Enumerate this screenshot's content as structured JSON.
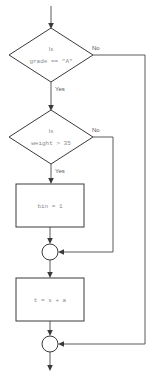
{
  "diagram": {
    "type": "flowchart",
    "title": "",
    "canvas": {
      "width": 152,
      "height": 377,
      "background": "#ffffff"
    },
    "colors": {
      "shape_stroke": "#3a3a3a",
      "connector_line": "#5a5a5a",
      "shape_fill": "#ffffff",
      "node_text": "#8a8a8a",
      "edge_label": "#555555"
    },
    "nodes": [
      {
        "id": "decision-grade",
        "shape": "diamond",
        "line1": "Is",
        "line2": "grade == \"A\"",
        "cx": 51,
        "cy": 55,
        "rx": 42,
        "ry": 27
      },
      {
        "id": "decision-weight",
        "shape": "diamond",
        "line1": "Is",
        "line2": "weight > 35",
        "cx": 51,
        "cy": 137,
        "rx": 42,
        "ry": 27
      },
      {
        "id": "process-bin",
        "shape": "rectangle",
        "text": "bin = 1",
        "x": 16,
        "y": 184,
        "w": 68,
        "h": 43
      },
      {
        "id": "process-sum",
        "shape": "rectangle",
        "text": "t = s + a",
        "x": 16,
        "y": 278,
        "w": 68,
        "h": 43
      },
      {
        "id": "merge-1",
        "shape": "circle",
        "cx": 50,
        "cy": 252,
        "r": 8
      },
      {
        "id": "merge-2",
        "shape": "circle",
        "cx": 50,
        "cy": 344,
        "r": 8
      }
    ],
    "edge_labels": [
      {
        "id": "grade-no",
        "text": "No",
        "x": 92,
        "y": 48
      },
      {
        "id": "grade-yes",
        "text": "Yes",
        "x": 55,
        "y": 89
      },
      {
        "id": "weight-no",
        "text": "No",
        "x": 92,
        "y": 130
      },
      {
        "id": "weight-yes",
        "text": "Yes",
        "x": 55,
        "y": 171
      }
    ],
    "edges": [
      {
        "id": "entry-to-grade",
        "from": "entry",
        "to": "decision-grade"
      },
      {
        "id": "grade-yes-to-weight",
        "from": "decision-grade",
        "to": "decision-weight",
        "label": "Yes"
      },
      {
        "id": "grade-no-to-merge2",
        "from": "decision-grade",
        "to": "merge-2",
        "label": "No"
      },
      {
        "id": "weight-yes-to-bin",
        "from": "decision-weight",
        "to": "process-bin",
        "label": "Yes"
      },
      {
        "id": "weight-no-to-merge1",
        "from": "decision-weight",
        "to": "merge-1",
        "label": "No"
      },
      {
        "id": "bin-to-merge1",
        "from": "process-bin",
        "to": "merge-1"
      },
      {
        "id": "merge1-to-sum",
        "from": "merge-1",
        "to": "process-sum"
      },
      {
        "id": "sum-to-merge2",
        "from": "process-sum",
        "to": "merge-2"
      },
      {
        "id": "merge2-to-exit",
        "from": "merge-2",
        "to": "exit"
      }
    ]
  }
}
